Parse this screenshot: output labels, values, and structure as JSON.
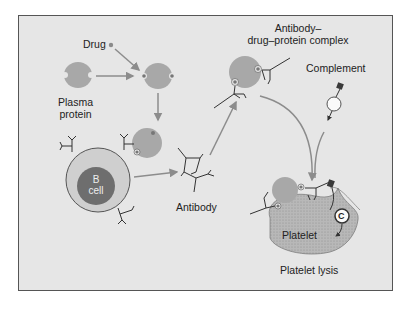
{
  "labels": {
    "drug": "Drug",
    "plasma_protein_line1": "Plasma",
    "plasma_protein_line2": "protein",
    "complex_line1": "Antibody–",
    "complex_line2": "drug–protein complex",
    "complement": "Complement",
    "b_cell_line1": "B",
    "b_cell_line2": "cell",
    "antibody": "Antibody",
    "platelet": "Platelet",
    "platelet_lysis": "Platelet lysis",
    "complement_marker": "C"
  },
  "colors": {
    "background": "#e6e6e6",
    "protein": "#a8a8a8",
    "drug": "#8a8a8a",
    "bcell_outer": "#cfcfcf",
    "bcell_nucleus": "#6e6e6e",
    "arrow": "#8c8c8c",
    "complement_dark": "#3a3a3a",
    "platelet": "#b5b5b5"
  }
}
